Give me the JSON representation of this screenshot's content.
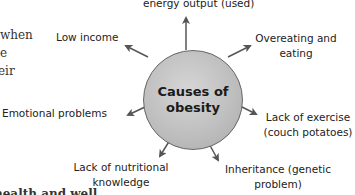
{
  "background_text": {
    "line1": "when",
    "line2": "e",
    "line3": "eir",
    "bottom_line": "health and well"
  },
  "diagram": {
    "center": {
      "title": "Causes of obesity",
      "fill_color": "#bdbdbd",
      "stroke_color": "#666666"
    },
    "arrow_color": "#555555",
    "causes": [
      {
        "id": "top",
        "label": "energy output (used)"
      },
      {
        "id": "top-left",
        "label": "Low income"
      },
      {
        "id": "top-right",
        "label_line1": "Overeating and",
        "label_line2": "eating"
      },
      {
        "id": "left",
        "label": "Emotional problems"
      },
      {
        "id": "right",
        "label_line1": "Lack of exercise",
        "label_line2": "(couch potatoes)"
      },
      {
        "id": "bottom-left",
        "label_line1": "Lack of nutritional",
        "label_line2": "knowledge"
      },
      {
        "id": "bottom-right",
        "label_line1": "Inheritance (genetic",
        "label_line2": "problem)"
      }
    ]
  }
}
